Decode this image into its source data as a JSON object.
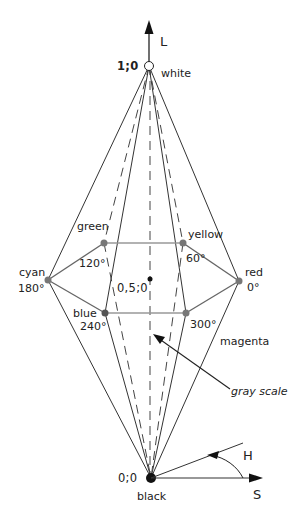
{
  "diagram": {
    "axes": {
      "lightness": {
        "label": "L"
      },
      "saturation": {
        "label": "S"
      },
      "hue": {
        "label": "H"
      }
    },
    "apexes": {
      "white": {
        "label": "white",
        "coord": "1;0"
      },
      "black": {
        "label": "black",
        "coord": "0;0"
      }
    },
    "center": {
      "coord": "0,5;0"
    },
    "hues": [
      {
        "name": "red",
        "angle": "0°"
      },
      {
        "name": "yellow",
        "angle": "60°"
      },
      {
        "name": "green",
        "angle": "120°"
      },
      {
        "name": "cyan",
        "angle": "180°"
      },
      {
        "name": "blue",
        "angle": "240°"
      },
      {
        "name": "magenta",
        "angle": "300°"
      }
    ],
    "annotations": {
      "gray_scale": "gray scale"
    },
    "colors": {
      "line": "#333333",
      "dashed": "#444444",
      "hue_point": "#777777",
      "hex_edge": "#888888"
    }
  }
}
